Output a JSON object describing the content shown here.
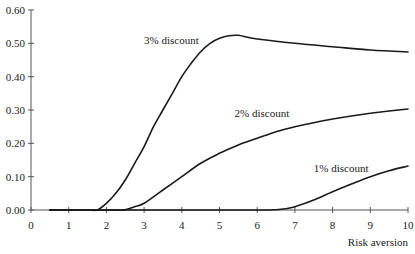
{
  "chart_data": {
    "type": "line",
    "title": "",
    "xlabel": "Risk aversion",
    "ylabel": "",
    "xlim": [
      0,
      10
    ],
    "ylim": [
      0,
      0.6
    ],
    "x_ticks": [
      0,
      1,
      2,
      3,
      4,
      5,
      6,
      7,
      8,
      9,
      10
    ],
    "x_tick_labels": [
      "0",
      "1",
      "2",
      "3",
      "4",
      "5",
      "6",
      "7",
      "8",
      "9",
      "10"
    ],
    "y_ticks": [
      0,
      0.1,
      0.2,
      0.3,
      0.4,
      0.5,
      0.6
    ],
    "y_tick_labels": [
      "0.00",
      "0.10",
      "0.20",
      "0.30",
      "0.40",
      "0.50",
      "0.60"
    ],
    "grid": false,
    "legend": "inline labels",
    "series": [
      {
        "name": "3% discount",
        "label_pos": [
          3.0,
          0.51
        ],
        "x": [
          0.5,
          1.0,
          1.5,
          1.75,
          2.0,
          2.25,
          2.5,
          2.75,
          3.0,
          3.25,
          3.5,
          3.75,
          4.0,
          4.25,
          4.5,
          4.75,
          5.0,
          5.25,
          5.5,
          5.75,
          6.0,
          7.0,
          8.0,
          9.0,
          10.0
        ],
        "values": [
          0.0,
          0.0,
          0.0,
          0.0,
          0.02,
          0.05,
          0.09,
          0.14,
          0.19,
          0.25,
          0.3,
          0.35,
          0.4,
          0.44,
          0.475,
          0.5,
          0.515,
          0.523,
          0.524,
          0.518,
          0.513,
          0.5,
          0.49,
          0.48,
          0.474
        ]
      },
      {
        "name": "2% discount",
        "label_pos": [
          5.4,
          0.29
        ],
        "x": [
          0.5,
          1.0,
          2.0,
          2.45,
          2.75,
          3.0,
          3.5,
          4.0,
          4.5,
          5.0,
          5.5,
          6.0,
          6.5,
          7.0,
          7.5,
          8.0,
          8.5,
          9.0,
          9.5,
          10.0
        ],
        "values": [
          0.0,
          0.0,
          0.0,
          0.0,
          0.01,
          0.02,
          0.06,
          0.1,
          0.14,
          0.17,
          0.195,
          0.215,
          0.235,
          0.25,
          0.262,
          0.273,
          0.282,
          0.29,
          0.297,
          0.303
        ]
      },
      {
        "name": "1% discount",
        "label_pos": [
          7.5,
          0.125
        ],
        "x": [
          0.5,
          2.0,
          4.0,
          6.0,
          6.5,
          6.75,
          7.0,
          7.5,
          8.0,
          8.5,
          9.0,
          9.5,
          10.0
        ],
        "values": [
          0.0,
          0.0,
          0.0,
          0.0,
          0.001,
          0.004,
          0.01,
          0.03,
          0.055,
          0.078,
          0.1,
          0.118,
          0.132
        ]
      }
    ]
  }
}
